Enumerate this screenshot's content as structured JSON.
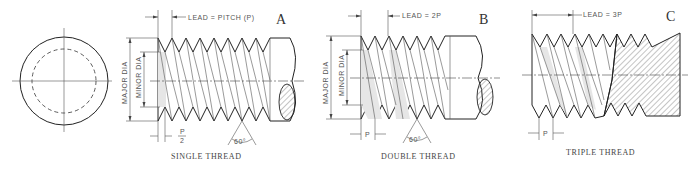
{
  "figure": {
    "end_view": {
      "label": "end-view-circles"
    },
    "panels": [
      {
        "letter": "A",
        "caption": "SINGLE THREAD",
        "lead_label": "LEAD = PITCH (P)",
        "major_dia_label": "MAJOR DIA",
        "minor_dia_label": "MINOR DIA",
        "pitch_label_num": "P",
        "pitch_label_den": "2",
        "angle_label": "60°"
      },
      {
        "letter": "B",
        "caption": "DOUBLE THREAD",
        "lead_label": "LEAD = 2P",
        "major_dia_label": "MAJOR DIA",
        "minor_dia_label": "MINOR DIA",
        "pitch_label": "P",
        "angle_label": "60°"
      },
      {
        "letter": "C",
        "caption": "TRIPLE THREAD",
        "lead_label": "LEAD = 3P",
        "pitch_label": "P"
      }
    ]
  }
}
